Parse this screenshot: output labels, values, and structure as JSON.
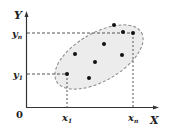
{
  "diagram": {
    "axes": {
      "x_label": "X",
      "y_label": "Y",
      "origin_label": "0"
    },
    "ticks": {
      "x1_label": "x",
      "x1_sub": "1",
      "xn_label": "x",
      "xn_sub": "n",
      "y1_label": "y",
      "y1_sub": "1",
      "yn_label": "y",
      "yn_sub": "n"
    },
    "points": [
      {
        "x": 67,
        "y": 74
      },
      {
        "x": 75,
        "y": 54
      },
      {
        "x": 89,
        "y": 78
      },
      {
        "x": 95,
        "y": 62
      },
      {
        "x": 104,
        "y": 44
      },
      {
        "x": 114,
        "y": 25
      },
      {
        "x": 123,
        "y": 32
      },
      {
        "x": 122,
        "y": 55
      },
      {
        "x": 133,
        "y": 33
      }
    ],
    "region": {
      "shape": "ellipse",
      "fill": "#ececec",
      "stroke": "#888888"
    },
    "colors": {
      "axis": "#333333",
      "dash": "#555555",
      "point": "#111111"
    }
  }
}
